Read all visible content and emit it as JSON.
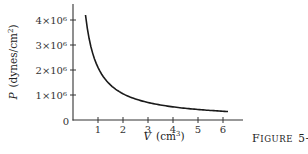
{
  "chart_data": {
    "type": "line",
    "title": "",
    "caption": "Figure 5-7",
    "xlabel": "V (cm³)",
    "xlabel_var": "V",
    "xlabel_unit": "(cm",
    "xlabel_unit_sup": "3",
    "ylabel": "P (dynes/cm²)",
    "ylabel_var": "P",
    "ylabel_unit": "(dynes/cm",
    "ylabel_unit_sup": "2",
    "xlim": [
      0,
      6.8
    ],
    "ylim": [
      0,
      4600000.0
    ],
    "origin_label": "0",
    "x_ticks": [
      1,
      2,
      3,
      4,
      5,
      6
    ],
    "x_tick_labels": [
      "1",
      "2",
      "3",
      "4",
      "5",
      "6"
    ],
    "y_ticks": [
      1000000,
      2000000,
      3000000,
      4000000
    ],
    "y_tick_labels": [
      "1×10⁶",
      "2×10⁶",
      "3×10⁶",
      "4×10⁶"
    ],
    "grid": false,
    "series": [
      {
        "name": "PV = const",
        "relation": "P = 2.1e6 / V",
        "x": [
          0.5,
          0.75,
          1.0,
          1.5,
          2.0,
          2.5,
          3.0,
          3.5,
          4.0,
          4.5,
          5.0,
          5.5,
          6.0,
          6.2
        ],
        "y": [
          4200000,
          2800000,
          2100000,
          1400000,
          1050000,
          840000,
          700000,
          600000,
          525000,
          467000,
          420000,
          382000,
          350000,
          339000
        ]
      }
    ]
  }
}
